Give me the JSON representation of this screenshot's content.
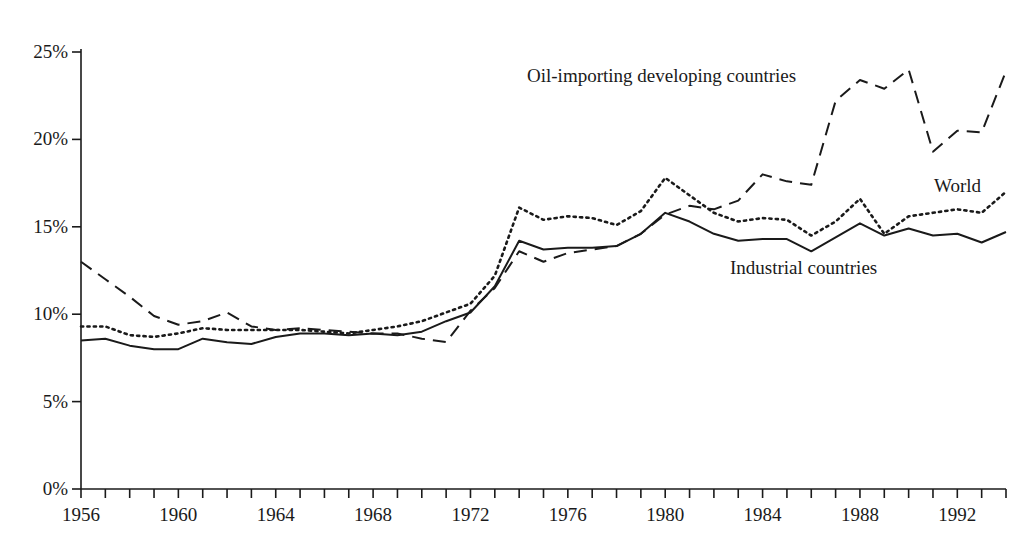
{
  "chart_data": {
    "type": "line",
    "title": "",
    "subtitle": "",
    "xlabel": "",
    "ylabel": "",
    "xlim": [
      1956,
      1994
    ],
    "ylim": [
      0,
      25
    ],
    "grid": false,
    "legend_position": "inline-annotations",
    "y_ticks": [
      0,
      5,
      10,
      15,
      20,
      25
    ],
    "y_tick_labels": [
      "0%",
      "5%",
      "10%",
      "15%",
      "20%",
      "25%"
    ],
    "x_ticks": [
      1956,
      1957,
      1958,
      1959,
      1960,
      1961,
      1962,
      1963,
      1964,
      1965,
      1966,
      1967,
      1968,
      1969,
      1970,
      1971,
      1972,
      1973,
      1974,
      1975,
      1976,
      1977,
      1978,
      1979,
      1980,
      1981,
      1982,
      1983,
      1984,
      1985,
      1986,
      1987,
      1988,
      1989,
      1990,
      1991,
      1992,
      1993,
      1994
    ],
    "x_tick_labels_shown": [
      "1956",
      "1960",
      "1964",
      "1968",
      "1972",
      "1976",
      "1980",
      "1984",
      "1988",
      "1992"
    ],
    "x_tick_labels_shown_years": [
      1956,
      1960,
      1964,
      1968,
      1972,
      1976,
      1980,
      1984,
      1988,
      1992
    ],
    "x": [
      1956,
      1957,
      1958,
      1959,
      1960,
      1961,
      1962,
      1963,
      1964,
      1965,
      1966,
      1967,
      1968,
      1969,
      1970,
      1971,
      1972,
      1973,
      1974,
      1975,
      1976,
      1977,
      1978,
      1979,
      1980,
      1981,
      1982,
      1983,
      1984,
      1985,
      1986,
      1987,
      1988,
      1989,
      1990,
      1991,
      1992,
      1993,
      1994
    ],
    "series": [
      {
        "name": "Industrial countries",
        "style": "solid",
        "color": "#1a1a1a",
        "values": [
          8.5,
          8.6,
          8.2,
          8.0,
          8.0,
          8.6,
          8.4,
          8.3,
          8.7,
          8.9,
          8.9,
          8.8,
          8.9,
          8.8,
          9.0,
          9.6,
          10.1,
          11.6,
          14.2,
          13.7,
          13.8,
          13.8,
          13.9,
          14.6,
          15.8,
          15.3,
          14.6,
          14.2,
          14.3,
          14.3,
          13.6,
          14.4,
          15.2,
          14.5,
          14.9,
          14.5,
          14.6,
          14.1,
          14.7
        ]
      },
      {
        "name": "World",
        "style": "dotted",
        "color": "#1a1a1a",
        "values": [
          9.3,
          9.3,
          8.8,
          8.7,
          8.9,
          9.2,
          9.1,
          9.1,
          9.1,
          9.1,
          9.0,
          8.9,
          9.1,
          9.3,
          9.6,
          10.1,
          10.6,
          12.2,
          16.1,
          15.4,
          15.6,
          15.5,
          15.1,
          15.9,
          17.8,
          16.8,
          15.8,
          15.3,
          15.5,
          15.4,
          14.5,
          15.3,
          16.6,
          14.6,
          15.6,
          15.8,
          16.0,
          15.8,
          17.0
        ]
      },
      {
        "name": "Oil-importing developing countries",
        "style": "dashed",
        "color": "#1a1a1a",
        "values": [
          13.0,
          12.0,
          11.0,
          9.9,
          9.4,
          9.6,
          10.1,
          9.3,
          9.1,
          9.2,
          9.1,
          9.0,
          8.9,
          8.9,
          8.6,
          8.4,
          10.2,
          11.5,
          13.6,
          13.0,
          13.5,
          13.7,
          13.9,
          14.6,
          15.7,
          16.2,
          16.0,
          16.5,
          18.0,
          17.6,
          17.4,
          22.2,
          23.4,
          22.9,
          24.0,
          19.3,
          20.5,
          20.4,
          23.9
        ]
      }
    ],
    "annotations": [
      {
        "text": "Oil-importing developing countries",
        "x_px": 527,
        "y_px": 66
      },
      {
        "text": "World",
        "x_px": 934,
        "y_px": 176
      },
      {
        "text": "Industrial countries",
        "x_px": 730,
        "y_px": 258
      }
    ]
  },
  "axes": {
    "y_axis_name": "percent-axis",
    "x_axis_name": "year-axis"
  }
}
